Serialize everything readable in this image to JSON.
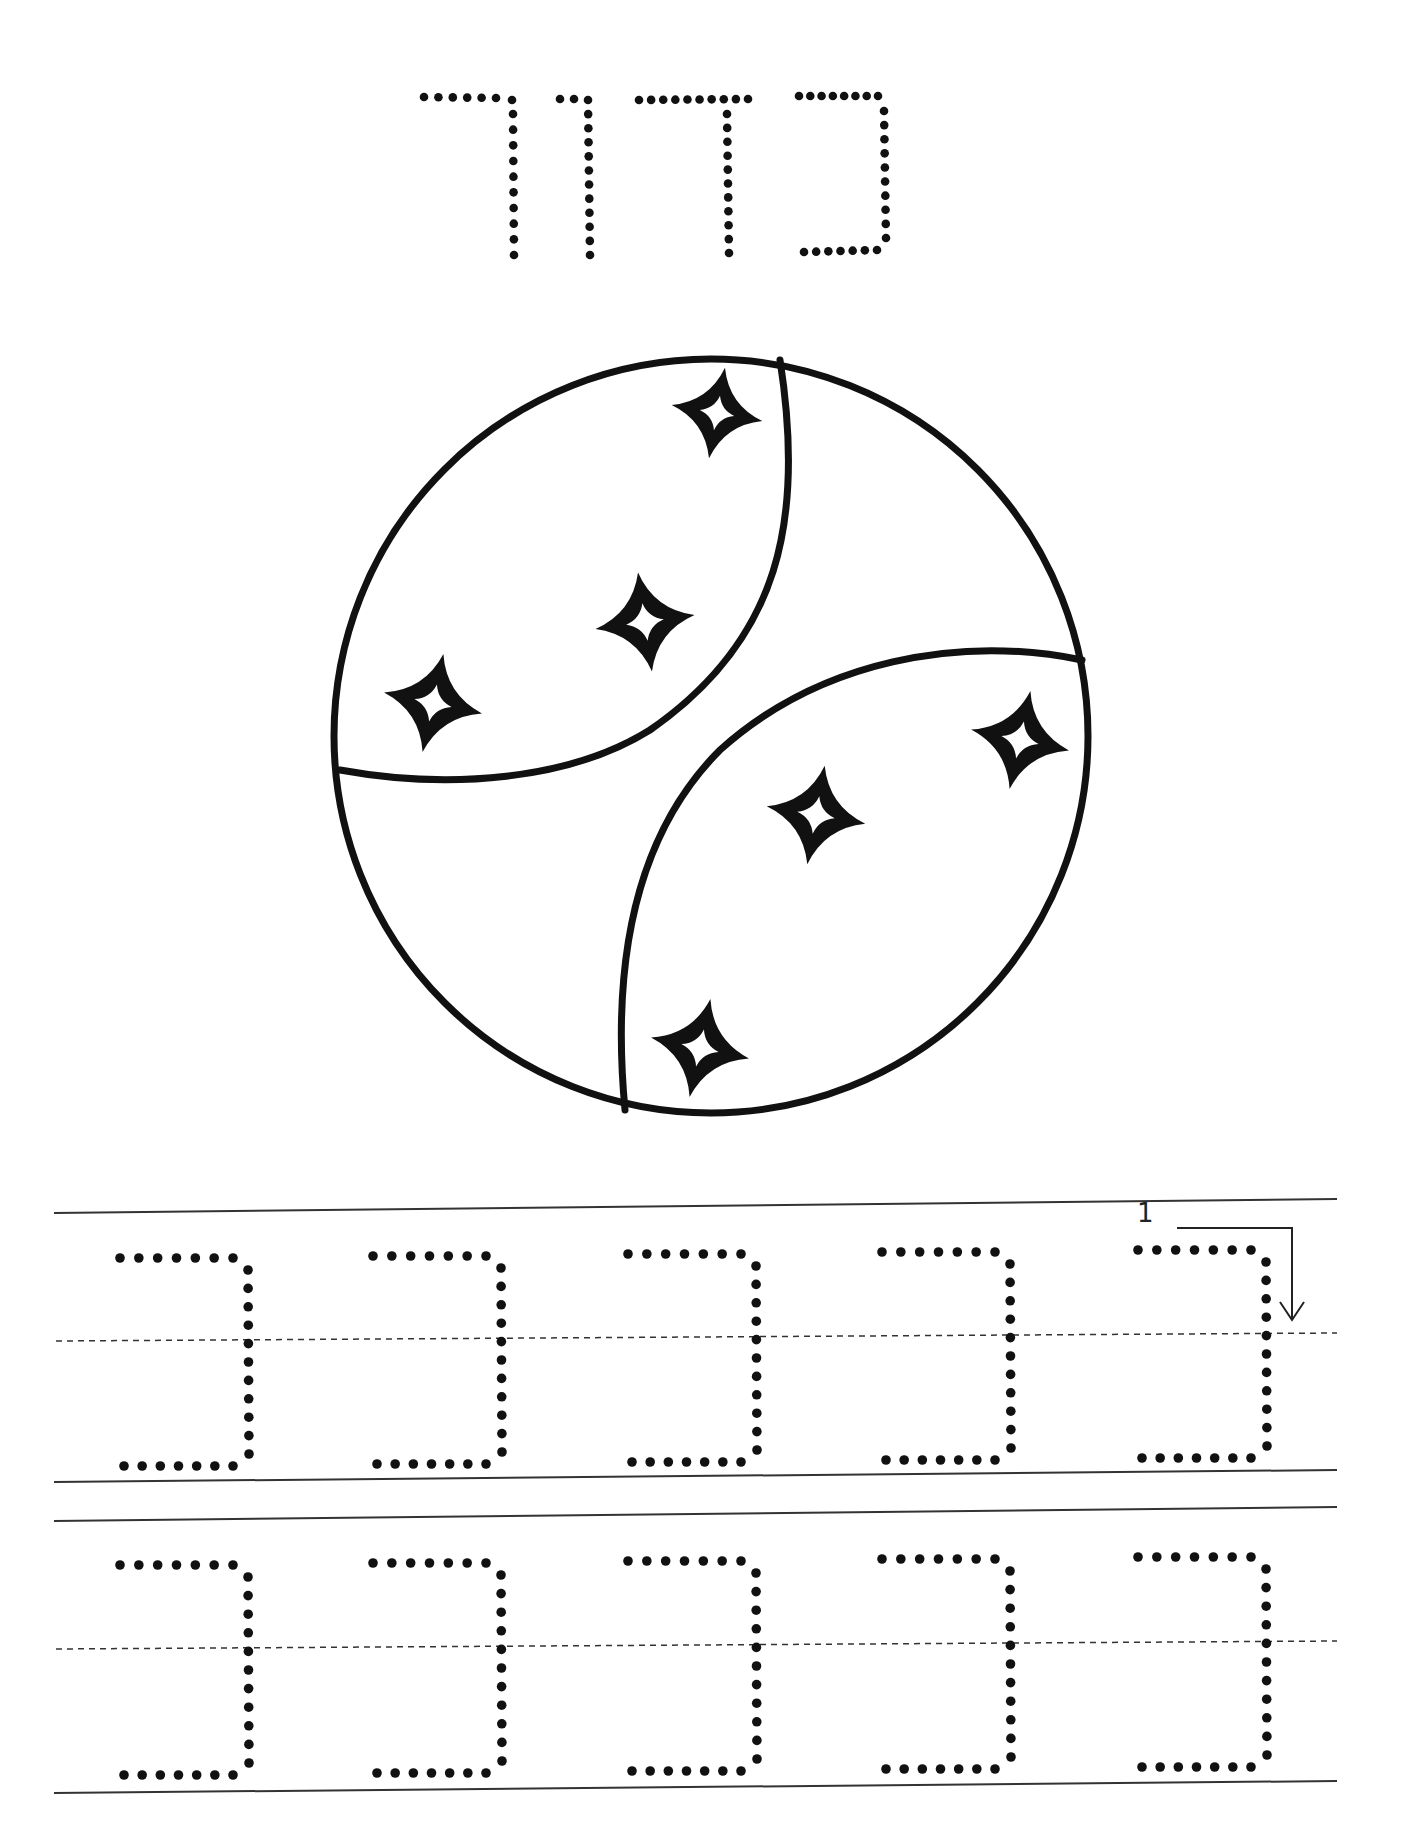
{
  "worksheet": {
    "word": "כדור",
    "word_letters_rtl": [
      "כ",
      "ד",
      "ו",
      "ר"
    ],
    "practice_letter": "כ",
    "illustration": "ball-with-stars",
    "star_count": 7,
    "stroke_guide": {
      "step_number": "1"
    },
    "rows": [
      {
        "letters": [
          "כ",
          "כ",
          "כ",
          "כ",
          "כ"
        ]
      },
      {
        "letters": [
          "כ",
          "כ",
          "כ",
          "כ",
          "כ"
        ]
      }
    ],
    "colors": {
      "ink": "#111111",
      "line": "#333333",
      "background": "#ffffff"
    }
  }
}
